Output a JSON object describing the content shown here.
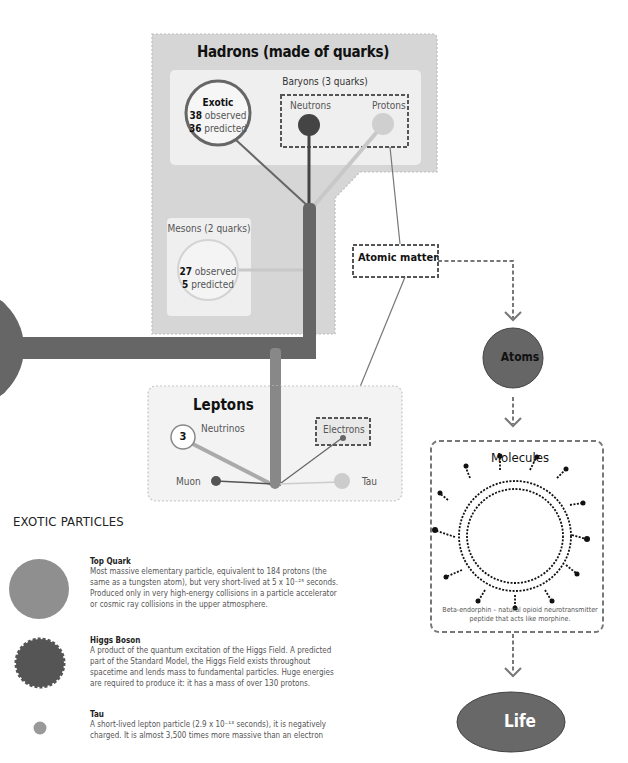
{
  "colors": {
    "dark": "#555555",
    "medium": "#777777",
    "light": "#bbbbbb",
    "panel_bg": "#d6d6d6",
    "inner_bg": "#efefef",
    "leptons_bg": "#f3f3f3",
    "life_fill": "#686868",
    "atoms_fill": "#666666"
  },
  "hadrons": {
    "title": "Hadrons (made of quarks)",
    "baryons": {
      "label": "Baryons (3 quarks)",
      "exotic": {
        "title": "Exotic",
        "observed_count": "38",
        "observed_label": " observed",
        "predicted_count": "36",
        "predicted_label": " predicted"
      },
      "neutrons_label": "Neutrons",
      "protons_label": "Protons"
    },
    "mesons": {
      "label": "Mesons (2 quarks)",
      "observed_count": "27",
      "observed_label": " observed",
      "predicted_count": "5",
      "predicted_label": " predicted"
    }
  },
  "atomic_matter": {
    "label": "Atomic matter"
  },
  "leptons": {
    "title": "Leptons",
    "neutrinos_label": "Neutrinos",
    "neutrinos_count": "3",
    "electrons_label": "Electrons",
    "muon_label": "Muon",
    "tau_label": "Tau"
  },
  "flow": {
    "atoms_label": "Atoms",
    "molecules_title": "Molecules",
    "molecule_caption": "Beta-endorphin – natural opioid neurotransmitter peptide that acts like morphine.",
    "life_label": "Life"
  },
  "exotic_particles": {
    "section_title": "EXOTIC PARTICLES",
    "items": [
      {
        "icon": "top-quark-circle",
        "name": "Top Quark",
        "description": "Most massive elementary particle, equivalent to 184 protons (the same as a tungsten atom), but very short-lived at 5 x 10⁻²⁵ seconds. Produced only in very high-energy collisions in a particle accelerator or cosmic ray collisions in the upper atmosphere."
      },
      {
        "icon": "higgs-boson-circle",
        "name": "Higgs Boson",
        "description": "A product of the quantum excitation of the Higgs Field. A predicted part of the Standard Model, the Higgs Field exists throughout spacetime and lends mass to fundamental particles. Huge energies are required to produce it: it has a mass of over 130 protons."
      },
      {
        "icon": "tau-circle",
        "name": "Tau",
        "description": "A short-lived lepton particle (2.9 x 10⁻¹³ seconds), it is negatively charged. It is almost 3,500 times more massive than an electron"
      }
    ]
  }
}
